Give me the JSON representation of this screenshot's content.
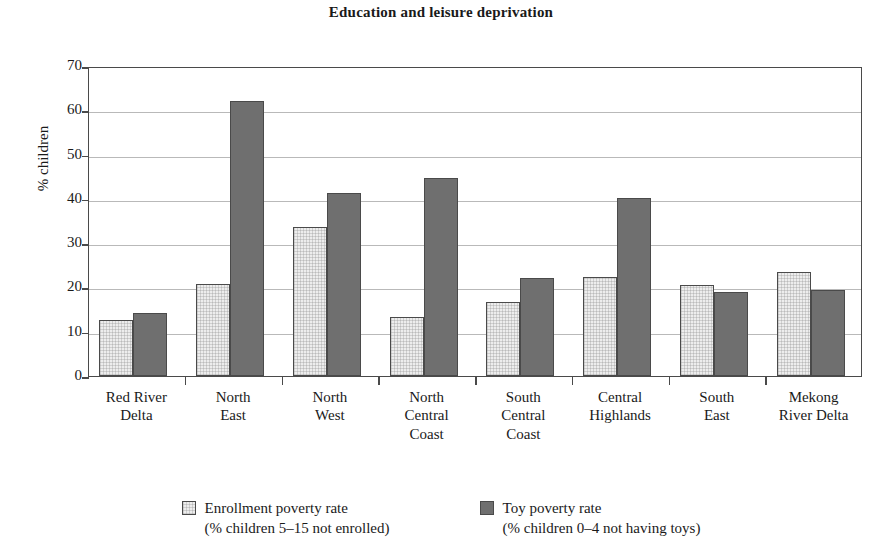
{
  "chart_data": {
    "type": "bar",
    "title": "Education and leisure deprivation",
    "xlabel": "",
    "ylabel": "% children",
    "ylim": [
      0,
      70
    ],
    "ytick_step": 10,
    "yticks": [
      70,
      60,
      50,
      40,
      30,
      20,
      10,
      0
    ],
    "grid": true,
    "legend_position": "bottom",
    "categories": [
      "Red River Delta",
      "North East",
      "North West",
      "North Central Coast",
      "South Central Coast",
      "Central Highlands",
      "South East",
      "Mekong River Delta"
    ],
    "category_lines": [
      [
        "Red River",
        "Delta"
      ],
      [
        "North",
        "East"
      ],
      [
        "North",
        "West"
      ],
      [
        "North",
        "Central",
        "Coast"
      ],
      [
        "South",
        "Central",
        "Coast"
      ],
      [
        "Central",
        "Highlands"
      ],
      [
        "South",
        "East"
      ],
      [
        "Mekong",
        "River Delta"
      ]
    ],
    "series": [
      {
        "name": "Enrollment poverty rate",
        "sublabel": "(% children 5–15 not enrolled)",
        "color": "#ededed",
        "values": [
          12.6,
          20.7,
          33.7,
          13.3,
          16.8,
          22.4,
          20.5,
          23.6
        ]
      },
      {
        "name": "Toy poverty rate",
        "sublabel": "(% children 0–4 not having toys)",
        "color": "#6f6f6f",
        "values": [
          14.2,
          62.0,
          41.4,
          44.7,
          22.1,
          40.3,
          19.0,
          19.4
        ]
      }
    ]
  }
}
